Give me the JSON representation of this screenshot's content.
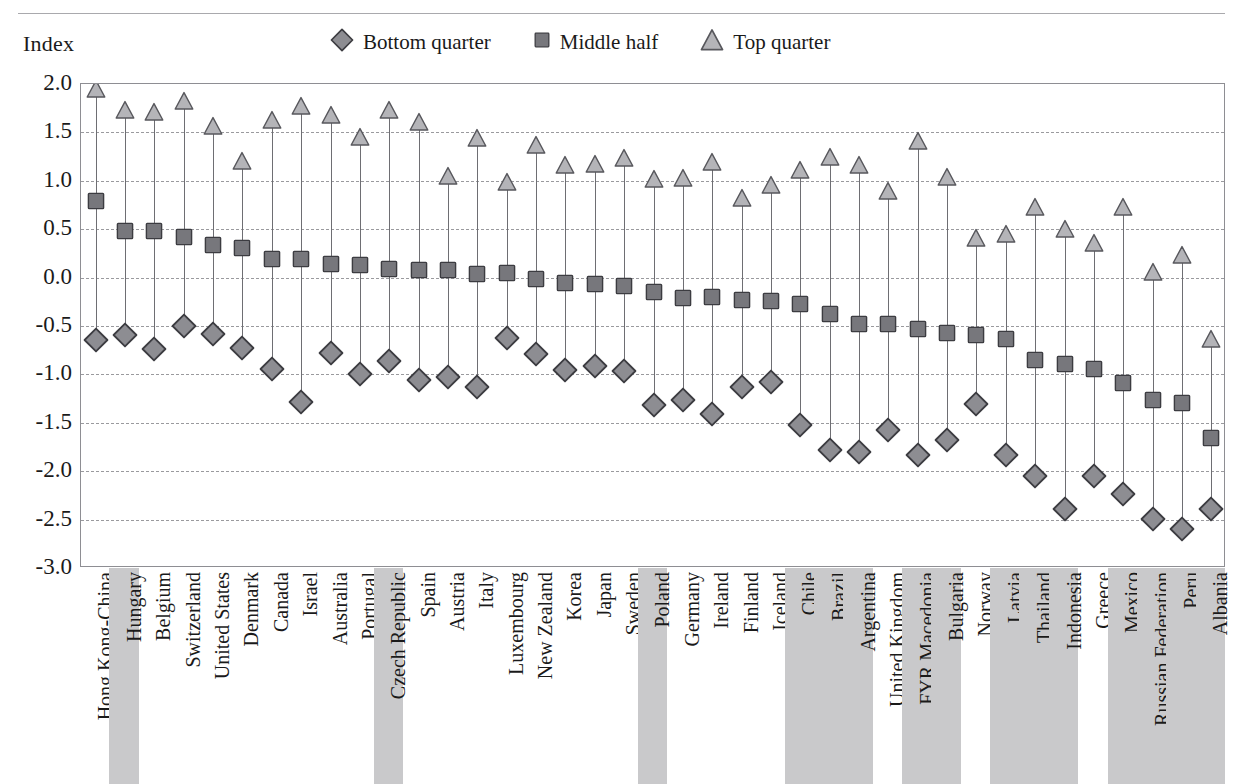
{
  "axis_caption": "Index",
  "legend": [
    {
      "name": "bottom-quarter",
      "label": "Bottom quarter",
      "marker": "diamond",
      "fill": "#8d8d92",
      "stroke": "#3c3c41"
    },
    {
      "name": "middle-half",
      "label": "Middle half",
      "marker": "square",
      "fill": "#77777c",
      "stroke": "#3c3c41"
    },
    {
      "name": "top-quarter",
      "label": "Top quarter",
      "marker": "triangle",
      "fill": "#b4b4b8",
      "stroke": "#57575c"
    }
  ],
  "colors": {
    "frame": "#8e8e93",
    "grid": "#9a9a9e",
    "stem": "#6e6e73",
    "band_shaded": "#c9c9cb",
    "text": "#1a1a1a"
  },
  "chart_data": {
    "type": "scatter",
    "title": "",
    "subtitle": "",
    "xlabel": "",
    "ylabel": "Index",
    "ylim": [
      -3.0,
      2.0
    ],
    "ytick_labels": [
      "2.0",
      "1.5",
      "1.0",
      "0.5",
      "0.0",
      "-0.5",
      "-1.0",
      "-1.5",
      "-2.0",
      "-2.5",
      "-3.0"
    ],
    "yticks": [
      2.0,
      1.5,
      1.0,
      0.5,
      0.0,
      -0.5,
      -1.0,
      -1.5,
      -2.0,
      -2.5,
      -3.0
    ],
    "grid": true,
    "legend_position": "top",
    "categories": [
      "Hong Kong-China",
      "Hungary",
      "Belgium",
      "Switzerland",
      "United States",
      "Denmark",
      "Canada",
      "Israel",
      "Australia",
      "Portugal",
      "Czech Republic",
      "Spain",
      "Austria",
      "Italy",
      "Luxembourg",
      "New Zealand",
      "Korea",
      "Japan",
      "Sweden",
      "Poland",
      "Germany",
      "Ireland",
      "Finland",
      "Iceland",
      "Chile",
      "Brazil",
      "Argentina",
      "United Kingdom",
      "FYR Macedonia",
      "Bulgaria",
      "Norway",
      "Latvia",
      "Thailand",
      "Indonesia",
      "Greece",
      "Mexico",
      "Russian Federation",
      "Peru",
      "Albania"
    ],
    "shaded_categories": [
      "Hungary",
      "Czech Republic",
      "Poland",
      "Chile",
      "Brazil",
      "Argentina",
      "FYR Macedonia",
      "Bulgaria",
      "Latvia",
      "Thailand",
      "Indonesia",
      "Mexico",
      "Russian Federation",
      "Peru",
      "Albania"
    ],
    "series": [
      {
        "name": "Bottom quarter",
        "marker": "diamond",
        "values": [
          -0.67,
          -0.61,
          -0.76,
          -0.52,
          -0.6,
          -0.75,
          -0.96,
          -1.31,
          -0.8,
          -1.02,
          -0.88,
          -1.08,
          -1.05,
          -1.15,
          -0.64,
          -0.81,
          -0.98,
          -0.93,
          -0.99,
          -1.34,
          -1.28,
          -1.43,
          -1.15,
          -1.1,
          -1.54,
          -1.8,
          -1.82,
          -1.59,
          -1.85,
          -1.7,
          -1.33,
          -1.85,
          -2.07,
          -2.41,
          -2.07,
          -2.26,
          -2.51,
          -2.62,
          -2.41
        ]
      },
      {
        "name": "Middle half",
        "marker": "square",
        "values": [
          0.77,
          0.46,
          0.46,
          0.4,
          0.32,
          0.29,
          0.17,
          0.17,
          0.12,
          0.11,
          0.07,
          0.06,
          0.06,
          0.02,
          0.03,
          -0.04,
          -0.08,
          -0.09,
          -0.11,
          -0.17,
          -0.23,
          -0.22,
          -0.25,
          -0.26,
          -0.29,
          -0.4,
          -0.5,
          -0.5,
          -0.55,
          -0.59,
          -0.61,
          -0.65,
          -0.87,
          -0.91,
          -0.96,
          -1.11,
          -1.29,
          -1.32,
          -1.68
        ]
      },
      {
        "name": "Top quarter",
        "marker": "triangle",
        "values": [
          1.93,
          1.71,
          1.69,
          1.8,
          1.55,
          1.18,
          1.61,
          1.75,
          1.66,
          1.43,
          1.71,
          1.59,
          1.03,
          1.42,
          0.97,
          1.35,
          1.14,
          1.15,
          1.22,
          1.0,
          1.01,
          1.17,
          0.8,
          0.94,
          1.09,
          1.23,
          1.14,
          0.87,
          1.39,
          1.02,
          0.39,
          0.43,
          0.71,
          0.48,
          0.34,
          0.71,
          0.04,
          0.21,
          -0.65
        ]
      }
    ]
  }
}
